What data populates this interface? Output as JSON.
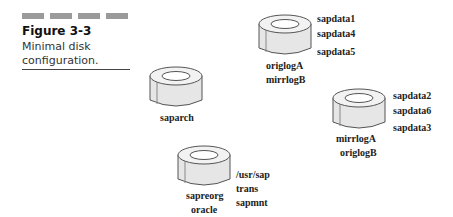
{
  "figure": {
    "number_label": "Figure 3-3",
    "caption": "Minimal disk configuration."
  },
  "disks": [
    {
      "id": "disk-1",
      "side_labels": [
        "sapdata1",
        "sapdata4",
        "sapdata5"
      ],
      "bottom_labels": [
        "origlogA",
        "mirrlogB"
      ]
    },
    {
      "id": "disk-2",
      "side_labels": [],
      "bottom_labels": [
        "saparch"
      ]
    },
    {
      "id": "disk-3",
      "side_labels": [
        "sapdata2",
        "sapdata6",
        "sapdata3"
      ],
      "bottom_labels": [
        "mirrlogA",
        "origlogB"
      ]
    },
    {
      "id": "disk-4",
      "side_labels": [
        "/usr/sap",
        "trans",
        "sapmnt"
      ],
      "bottom_labels": [
        "sapreorg",
        "oracle"
      ]
    }
  ],
  "colors": {
    "disk_side": "#e6e6e6",
    "disk_top": "#f2f2f2",
    "disk_outline": "#555555",
    "header_bars": "#9a9a9a"
  }
}
